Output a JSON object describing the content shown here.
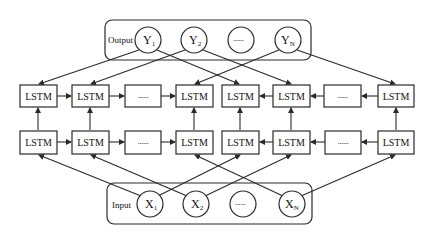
{
  "diagram": {
    "type": "bidirectional-lstm",
    "output_group": {
      "label": "Output",
      "nodes": [
        {
          "main": "Y",
          "sub": "1"
        },
        {
          "main": "Y",
          "sub": "2"
        },
        {
          "main": "......",
          "sub": ""
        },
        {
          "main": "Y",
          "sub": "N"
        }
      ]
    },
    "input_group": {
      "label": "Input",
      "nodes": [
        {
          "main": "X",
          "sub": "1"
        },
        {
          "main": "X",
          "sub": "2"
        },
        {
          "main": "......",
          "sub": ""
        },
        {
          "main": "X",
          "sub": "N"
        }
      ]
    },
    "forward_layer_top": [
      "LSTM",
      "LSTM",
      "......",
      "LSTM"
    ],
    "backward_layer_top": [
      "LSTM",
      "LSTM",
      "......",
      "LSTM"
    ],
    "forward_layer_bottom": [
      "LSTM",
      "LSTM",
      "......",
      "LSTM"
    ],
    "backward_layer_bottom": [
      "LSTM",
      "LSTM",
      "......",
      "LSTM"
    ],
    "colors": {
      "stroke": "#2a2a2a",
      "background": "#ffffff"
    }
  }
}
